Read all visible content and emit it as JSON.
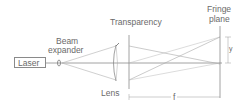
{
  "diagram": {
    "labels": {
      "laser": "Laser",
      "beam_expander_line1": "Beam",
      "beam_expander_line2": "expander",
      "transparency": "Transparency",
      "fringe_plane_line1": "Fringe",
      "fringe_plane_line2": "plane",
      "lens": "Lens",
      "focal_length": "f",
      "fringe_offset": "y"
    },
    "colors": {
      "line": "#9a9a9a",
      "axis": "#7a7a7a",
      "text": "#6a6a6a"
    }
  }
}
